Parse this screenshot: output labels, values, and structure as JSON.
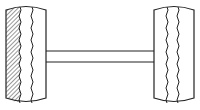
{
  "diagram": {
    "stroke_color": "#222222",
    "background": "#ffffff",
    "left_tire": {
      "x": 6,
      "y": 5,
      "w": 40,
      "h": 98,
      "hatched": true
    },
    "axle": {
      "x1": 46,
      "x2": 154,
      "y_top": 51,
      "y_bottom": 62
    },
    "right_tire": {
      "x": 154,
      "y": 5,
      "w": 40,
      "h": 98,
      "hatched": false
    }
  }
}
